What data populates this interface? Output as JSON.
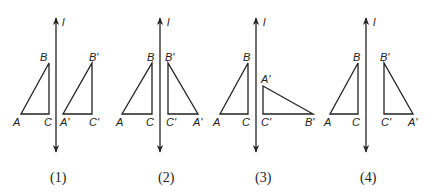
{
  "figures": [
    {
      "caption": "(1)",
      "axis_label": "l",
      "axis_x": 56,
      "original": {
        "A": [
          21,
          114
        ],
        "B": [
          49,
          63
        ],
        "C": [
          49,
          114
        ]
      },
      "image": {
        "A'": [
          63,
          114
        ],
        "B'": [
          92,
          63
        ],
        "C'": [
          92,
          114
        ]
      },
      "labels": {
        "A": "A",
        "B": "B",
        "C": "C",
        "A'": "A'",
        "B'": "B'",
        "C'": "C'"
      },
      "caption_x": 58
    },
    {
      "caption": "(2)",
      "axis_label": "l",
      "axis_x": 160,
      "original": {
        "A": [
          122,
          114
        ],
        "B": [
          152,
          63
        ],
        "C": [
          152,
          114
        ]
      },
      "image": {
        "A'": [
          198,
          114
        ],
        "B'": [
          168,
          63
        ],
        "C'": [
          168,
          114
        ]
      },
      "labels": {
        "A": "A",
        "B": "B",
        "C": "C",
        "A'": "A'",
        "B'": "B'",
        "C'": "C'"
      },
      "caption_x": 167
    },
    {
      "caption": "(3)",
      "axis_label": "l",
      "axis_x": 256,
      "original": {
        "A": [
          220,
          114
        ],
        "B": [
          248,
          63
        ],
        "C": [
          248,
          114
        ]
      },
      "image": {
        "A'": [
          263,
          86
        ],
        "B'": [
          313,
          114
        ],
        "C'": [
          263,
          114
        ]
      },
      "labels": {
        "A": "A",
        "B": "B",
        "C": "C",
        "A'": "A'",
        "B'": "B'",
        "C'": "C'"
      },
      "caption_x": 264
    },
    {
      "caption": "(4)",
      "axis_label": "l",
      "axis_x": 366,
      "original": {
        "A": [
          330,
          114
        ],
        "B": [
          358,
          63
        ],
        "C": [
          358,
          114
        ]
      },
      "image": {
        "A'": [
          413,
          114
        ],
        "B'": [
          384,
          63
        ],
        "C'": [
          384,
          114
        ]
      },
      "labels": {
        "A": "A",
        "B": "B",
        "C": "C",
        "A'": "A'",
        "B'": "B'",
        "C'": "C'"
      },
      "caption_x": 369
    }
  ]
}
